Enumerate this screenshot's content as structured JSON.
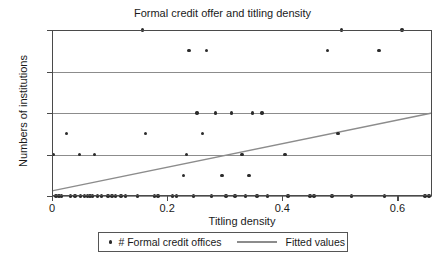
{
  "chart_data": {
    "type": "scatter",
    "title": "Formal credit offer and titling density",
    "xlabel": "Titling density",
    "ylabel": "Numbers of institutions",
    "xlim": [
      0,
      0.66
    ],
    "ylim": [
      0,
      8
    ],
    "xticks": [
      0,
      0.2,
      0.4,
      0.6
    ],
    "xticklabels": [
      "0",
      "0.2",
      "0.4",
      "0.6"
    ],
    "yticks": [
      0,
      2,
      4,
      6,
      8
    ],
    "yticklabels": [
      "0",
      "2",
      "4",
      "6",
      "8"
    ],
    "grid": "horizontal",
    "legend_position": "bottom-center",
    "series": [
      {
        "name": "# Formal credit offices",
        "type": "scatter",
        "marker": "circle",
        "color": "#2b2b2b",
        "points": [
          [
            0.003,
            2
          ],
          [
            0.007,
            0
          ],
          [
            0.012,
            0
          ],
          [
            0.016,
            0
          ],
          [
            0.025,
            3
          ],
          [
            0.032,
            0
          ],
          [
            0.04,
            0
          ],
          [
            0.048,
            2
          ],
          [
            0.05,
            0
          ],
          [
            0.056,
            0
          ],
          [
            0.062,
            0
          ],
          [
            0.066,
            0
          ],
          [
            0.07,
            0
          ],
          [
            0.074,
            2
          ],
          [
            0.079,
            0
          ],
          [
            0.086,
            0
          ],
          [
            0.097,
            0
          ],
          [
            0.104,
            0
          ],
          [
            0.11,
            0
          ],
          [
            0.12,
            0
          ],
          [
            0.128,
            0
          ],
          [
            0.148,
            0
          ],
          [
            0.157,
            8
          ],
          [
            0.162,
            3
          ],
          [
            0.178,
            0
          ],
          [
            0.184,
            0
          ],
          [
            0.209,
            0
          ],
          [
            0.216,
            0
          ],
          [
            0.228,
            1
          ],
          [
            0.234,
            2
          ],
          [
            0.238,
            7
          ],
          [
            0.246,
            0
          ],
          [
            0.252,
            4
          ],
          [
            0.261,
            3
          ],
          [
            0.268,
            7
          ],
          [
            0.277,
            0
          ],
          [
            0.284,
            4
          ],
          [
            0.295,
            1
          ],
          [
            0.302,
            0
          ],
          [
            0.312,
            4
          ],
          [
            0.318,
            0
          ],
          [
            0.33,
            2
          ],
          [
            0.336,
            0
          ],
          [
            0.342,
            1
          ],
          [
            0.348,
            4
          ],
          [
            0.356,
            0
          ],
          [
            0.365,
            4
          ],
          [
            0.374,
            0
          ],
          [
            0.405,
            2
          ],
          [
            0.41,
            0
          ],
          [
            0.448,
            0
          ],
          [
            0.455,
            0
          ],
          [
            0.478,
            7
          ],
          [
            0.486,
            0
          ],
          [
            0.497,
            3
          ],
          [
            0.503,
            8
          ],
          [
            0.52,
            0
          ],
          [
            0.568,
            7
          ],
          [
            0.578,
            0
          ],
          [
            0.608,
            8
          ],
          [
            0.648,
            0
          ],
          [
            0.655,
            0
          ]
        ]
      },
      {
        "name": "Fitted values",
        "type": "line",
        "color": "#8c8c8c",
        "endpoints": [
          [
            0,
            0.25
          ],
          [
            0.66,
            4.0
          ]
        ]
      }
    ]
  },
  "legend": {
    "scatter_label": "# Formal credit offices",
    "line_label": "Fitted values"
  }
}
